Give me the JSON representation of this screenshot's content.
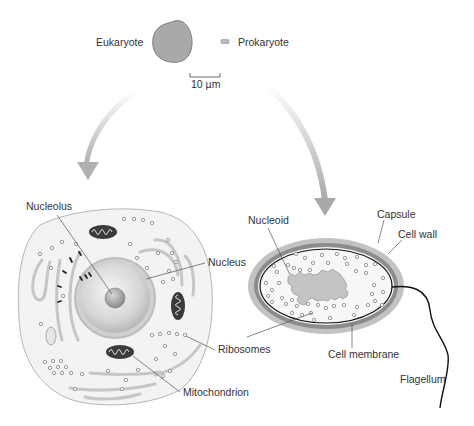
{
  "figure": {
    "type": "cell comparison diagram",
    "size_comparison": {
      "eukaryote_label": "Eukaryote",
      "prokaryote_label": "Prokaryote",
      "scale_bar_label": "10 µm"
    },
    "eukaryote_cell": {
      "labels": {
        "nucleolus": "Nucleolus",
        "nucleus": "Nucleus",
        "ribosomes": "Ribosomes",
        "mitochondrion": "Mitochondrion"
      }
    },
    "prokaryote_cell": {
      "labels": {
        "nucleoid": "Nucleoid",
        "capsule": "Capsule",
        "cell_wall": "Cell wall",
        "cell_membrane": "Cell membrane",
        "flagellum": "Flagellum"
      }
    },
    "colors": {
      "background": "#ffffff",
      "cell_fill": "#f3f3f3",
      "cell_outline": "#b5b5b5",
      "arrow": "#bdbdbd",
      "eukaryote_scale_fill": "#a9a9a9",
      "capsule": "#bdbdbd",
      "cell_wall": "#8c8c8c",
      "nucleoid": "#c4c4c4",
      "text": "#333333"
    }
  }
}
